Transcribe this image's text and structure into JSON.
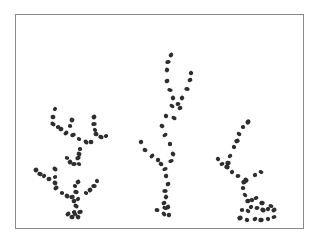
{
  "figure": {
    "frame": {
      "x": 15,
      "y": 14,
      "width": 289,
      "height": 215,
      "border_color": "#8a8a8a"
    },
    "dot_color": "#2e2e2e",
    "structures": [
      {
        "name": "left-branching-structure",
        "dots": [
          [
            55,
            109
          ],
          [
            53,
            117
          ],
          [
            53,
            124
          ],
          [
            58,
            127
          ],
          [
            61,
            129
          ],
          [
            66,
            133
          ],
          [
            70,
            126
          ],
          [
            72,
            120
          ],
          [
            73,
            135
          ],
          [
            79,
            139
          ],
          [
            94,
            117
          ],
          [
            94,
            124
          ],
          [
            95,
            130
          ],
          [
            96,
            134
          ],
          [
            101,
            137
          ],
          [
            106,
            136
          ],
          [
            91,
            142
          ],
          [
            86,
            142
          ],
          [
            80,
            149
          ],
          [
            79,
            154
          ],
          [
            78,
            158
          ],
          [
            67,
            158
          ],
          [
            70,
            162
          ],
          [
            74,
            164
          ],
          [
            79,
            164
          ],
          [
            36,
            170
          ],
          [
            40,
            174
          ],
          [
            44,
            176
          ],
          [
            49,
            179
          ],
          [
            55,
            169
          ],
          [
            55,
            177
          ],
          [
            55,
            183
          ],
          [
            56,
            188
          ],
          [
            62,
            193
          ],
          [
            67,
            196
          ],
          [
            72,
            197
          ],
          [
            75,
            186
          ],
          [
            78,
            182
          ],
          [
            76,
            192
          ],
          [
            78,
            199
          ],
          [
            74,
            201
          ],
          [
            76,
            206
          ],
          [
            74,
            212
          ],
          [
            72,
            217
          ],
          [
            68,
            214
          ],
          [
            75,
            214
          ],
          [
            78,
            217
          ],
          [
            80,
            212
          ],
          [
            86,
            193
          ],
          [
            90,
            190
          ],
          [
            94,
            186
          ],
          [
            97,
            181
          ]
        ]
      },
      {
        "name": "middle-branching-structure",
        "dots": [
          [
            171,
            55
          ],
          [
            168,
            62
          ],
          [
            167,
            70
          ],
          [
            167,
            81
          ],
          [
            170,
            90
          ],
          [
            173,
            98
          ],
          [
            178,
            104
          ],
          [
            172,
            106
          ],
          [
            166,
            116
          ],
          [
            162,
            126
          ],
          [
            165,
            135
          ],
          [
            170,
            144
          ],
          [
            173,
            154
          ],
          [
            171,
            161
          ],
          [
            191,
            73
          ],
          [
            190,
            80
          ],
          [
            187,
            89
          ],
          [
            182,
            98
          ],
          [
            180,
            108
          ],
          [
            174,
            118
          ],
          [
            141,
            142
          ],
          [
            145,
            150
          ],
          [
            152,
            156
          ],
          [
            158,
            160
          ],
          [
            161,
            164
          ],
          [
            165,
            169
          ],
          [
            166,
            176
          ],
          [
            168,
            184
          ],
          [
            165,
            191
          ],
          [
            166,
            197
          ],
          [
            164,
            203
          ],
          [
            165,
            208
          ],
          [
            168,
            207
          ],
          [
            157,
            210
          ],
          [
            164,
            214
          ],
          [
            169,
            215
          ]
        ]
      },
      {
        "name": "right-branching-structure",
        "dots": [
          [
            248,
            122
          ],
          [
            243,
            127
          ],
          [
            239,
            134
          ],
          [
            237,
            141
          ],
          [
            234,
            147
          ],
          [
            230,
            156
          ],
          [
            228,
            163
          ],
          [
            218,
            159
          ],
          [
            222,
            164
          ],
          [
            227,
            167
          ],
          [
            232,
            172
          ],
          [
            238,
            176
          ],
          [
            246,
            180
          ],
          [
            255,
            175
          ],
          [
            261,
            172
          ],
          [
            244,
            182
          ],
          [
            243,
            188
          ],
          [
            245,
            195
          ],
          [
            248,
            201
          ],
          [
            252,
            200
          ],
          [
            256,
            198
          ],
          [
            262,
            203
          ],
          [
            251,
            207
          ],
          [
            257,
            208
          ],
          [
            263,
            210
          ],
          [
            268,
            209
          ],
          [
            271,
            206
          ],
          [
            274,
            210
          ],
          [
            242,
            210
          ],
          [
            248,
            211
          ],
          [
            240,
            218
          ],
          [
            247,
            220
          ],
          [
            255,
            219
          ],
          [
            261,
            220
          ],
          [
            268,
            219
          ],
          [
            274,
            217
          ]
        ]
      }
    ]
  }
}
